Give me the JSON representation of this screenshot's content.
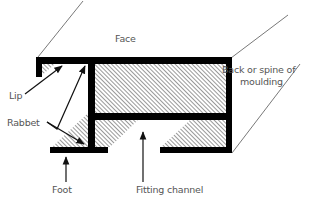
{
  "diagram": {
    "colors": {
      "profile": "#000000",
      "hatch": "#444444",
      "leader": "#111111",
      "perspective": "#555555",
      "label": "#555555",
      "background": "#ffffff"
    },
    "labels": {
      "face": "Face",
      "back_line1": "Back or spine of",
      "back_line2": "moulding",
      "lip": "Lip",
      "rabbet": "Rabbet",
      "foot": "Foot",
      "fitting_channel": "Fitting channel"
    }
  }
}
